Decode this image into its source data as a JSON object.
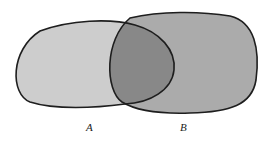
{
  "diagram": {
    "type": "venn",
    "sets": [
      {
        "label": "A",
        "color": "#cdcdcd"
      },
      {
        "label": "B",
        "color": "#ababab"
      }
    ],
    "intersection_color": "#888888",
    "outline_color": "#1e1e1e"
  }
}
